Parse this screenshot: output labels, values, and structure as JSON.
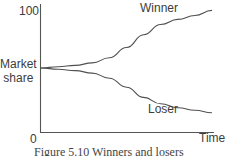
{
  "chart_data": {
    "type": "line",
    "title": "",
    "xlabel": "Time",
    "ylabel": "Market share",
    "y_ticks": [
      "0",
      "100"
    ],
    "ylim": [
      0,
      100
    ],
    "x_ticks": [],
    "grid": false,
    "legend": "inline labels",
    "x": [
      0,
      0.1,
      0.2,
      0.3,
      0.4,
      0.5,
      0.6,
      0.7,
      0.8,
      0.9,
      1.0
    ],
    "series": [
      {
        "name": "Winner",
        "values": [
          50,
          51,
          52,
          54,
          58,
          66,
          76,
          84,
          88,
          91,
          95
        ]
      },
      {
        "name": "Loser",
        "values": [
          50,
          49,
          48,
          46,
          42,
          35,
          27,
          22,
          19,
          17,
          15
        ]
      }
    ],
    "caption": "Figure 5.10   Winners and losers"
  },
  "labels": {
    "y_top": "100",
    "y_axis_line1": "Market",
    "y_axis_line2": "share",
    "origin": "0",
    "x_axis": "Time",
    "winner": "Winner",
    "loser": "Loser",
    "caption": "Figure 5.10   Winners and losers"
  },
  "colors": {
    "axis": "#555555",
    "line": "#505050",
    "text": "#3c3c3c"
  }
}
